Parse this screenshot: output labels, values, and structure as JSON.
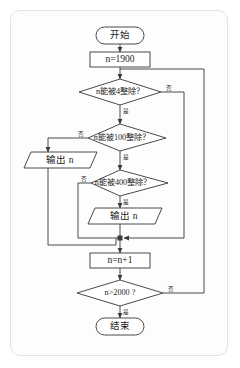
{
  "diagram": {
    "kind": "flowchart",
    "language": "zh",
    "card": {
      "background": "#fdfdfd",
      "border_color": "#e3e3e3"
    },
    "palette": {
      "stroke": "#4a4a4a",
      "fill": "#ffffff",
      "text": "#1c1c1c"
    },
    "nodes": [
      {
        "id": "start",
        "shape": "terminator",
        "label": "开始"
      },
      {
        "id": "init",
        "shape": "process",
        "label": "n=1900"
      },
      {
        "id": "dec4",
        "shape": "decision",
        "label": "n能被4整除？"
      },
      {
        "id": "dec100",
        "shape": "decision",
        "label": "n能被100整除？"
      },
      {
        "id": "out1",
        "shape": "input-output",
        "label": "输出 n"
      },
      {
        "id": "dec400",
        "shape": "decision",
        "label": "n能被400整除？"
      },
      {
        "id": "out2",
        "shape": "input-output",
        "label": "输出 n"
      },
      {
        "id": "incr",
        "shape": "process",
        "label": "n=n+1"
      },
      {
        "id": "dec2000",
        "shape": "decision",
        "label": "n>2000 ?"
      },
      {
        "id": "end",
        "shape": "terminator",
        "label": "结束"
      }
    ],
    "branch_labels": {
      "yes": "是",
      "no": "否",
      "dec4_no": "否",
      "dec4_yes": "是",
      "dec100_no": "否",
      "dec100_yes": "是",
      "dec400_no": "否",
      "dec400_yes": "是",
      "dec2000_no": "否",
      "dec2000_yes": "是"
    },
    "edges": [
      {
        "from": "start",
        "to": "init",
        "label": ""
      },
      {
        "from": "init",
        "to": "dec4",
        "label": ""
      },
      {
        "from": "dec4",
        "to": "dec100",
        "label": "是"
      },
      {
        "from": "dec4",
        "to": "incr",
        "label": "否"
      },
      {
        "from": "dec100",
        "to": "out1",
        "label": "否"
      },
      {
        "from": "dec100",
        "to": "dec400",
        "label": "是"
      },
      {
        "from": "out1",
        "to": "incr",
        "label": ""
      },
      {
        "from": "dec400",
        "to": "incr",
        "label": "否"
      },
      {
        "from": "dec400",
        "to": "out2",
        "label": "是"
      },
      {
        "from": "out2",
        "to": "incr",
        "label": ""
      },
      {
        "from": "incr",
        "to": "dec2000",
        "label": ""
      },
      {
        "from": "dec2000",
        "to": "dec4",
        "label": "否"
      },
      {
        "from": "dec2000",
        "to": "end",
        "label": "是"
      }
    ]
  }
}
